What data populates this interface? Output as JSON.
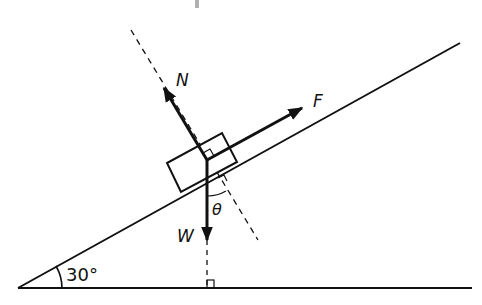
{
  "diagram": {
    "labels": {
      "normal_force": "N",
      "applied_force": "F",
      "weight": "W",
      "angle_theta": "θ",
      "incline_angle": "30°"
    },
    "colors": {
      "ink": "#111111",
      "background": "#ffffff",
      "top_mark": "#b0b0b0"
    }
  }
}
